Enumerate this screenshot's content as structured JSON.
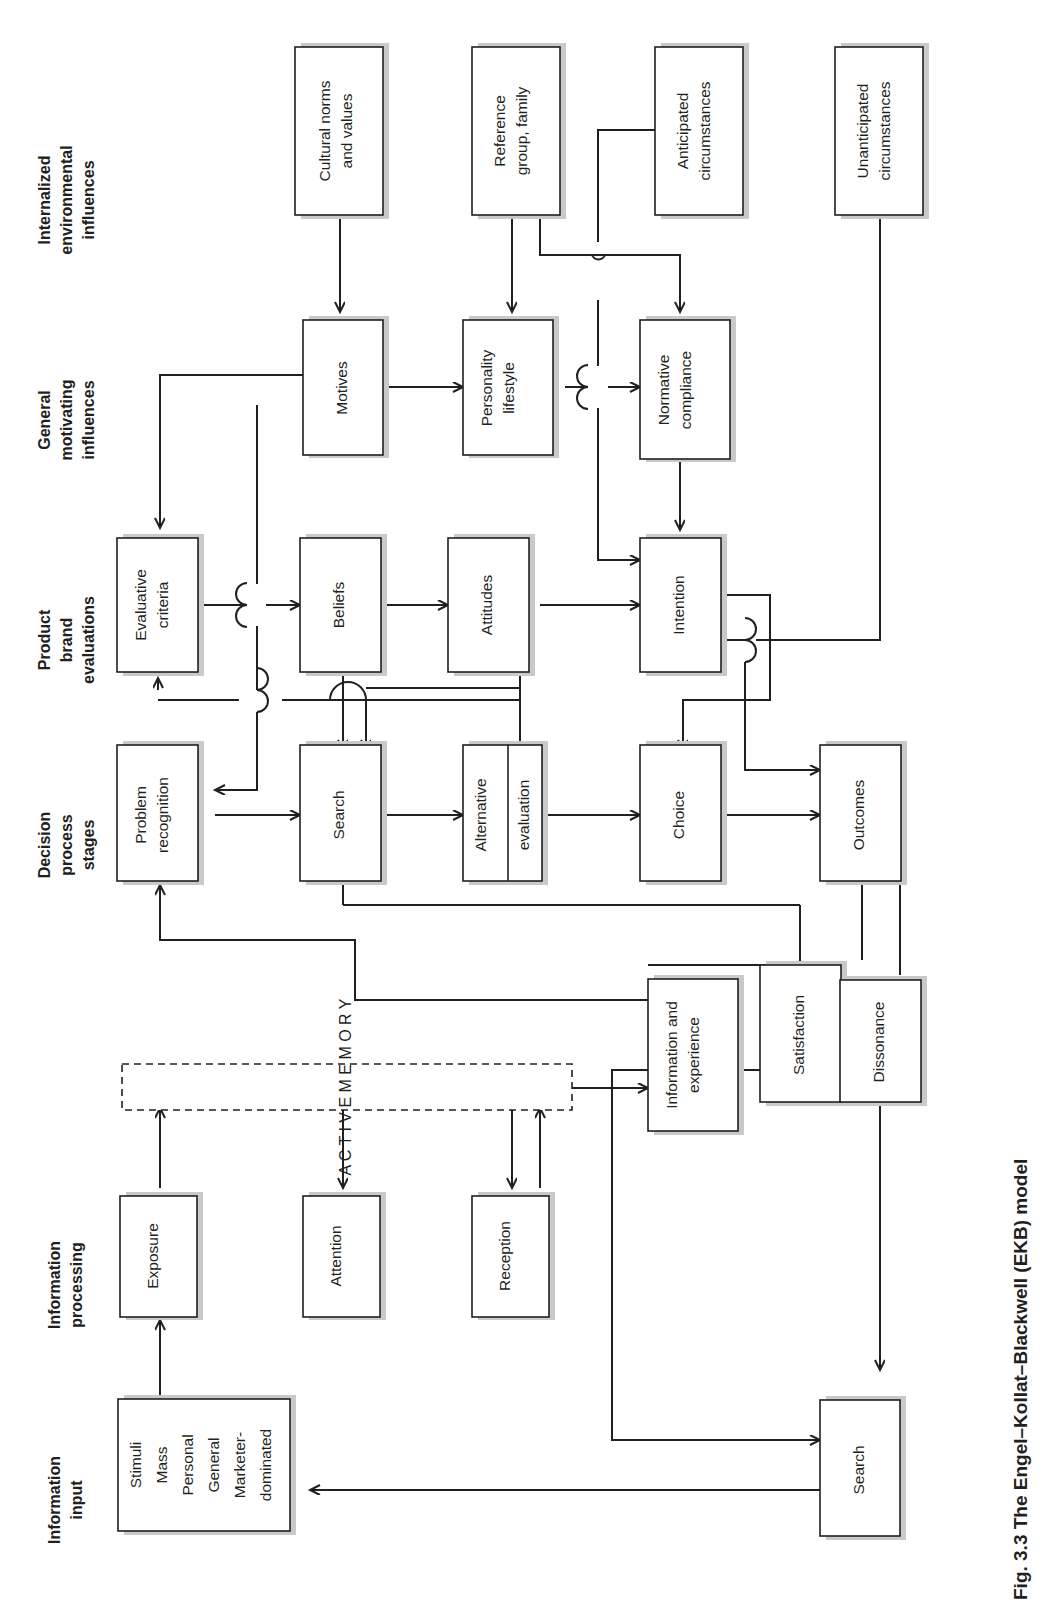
{
  "figure": {
    "caption": "Fig. 3.3  The Engel–Kollat–Blackwell (EKB) model",
    "orientation": "rotated-90-ccw",
    "colors": {
      "ink": "#231f20",
      "shadow": "#c9c9c9",
      "paper": "#ffffff"
    }
  },
  "columns": [
    {
      "id": "internalized",
      "label": "Internalized\nenvironmental\ninfluences"
    },
    {
      "id": "general",
      "label": "General\nmotivating\ninfluences"
    },
    {
      "id": "product",
      "label": "Product\nbrand\nevaluations"
    },
    {
      "id": "decision",
      "label": "Decision\nprocess\nstages"
    },
    {
      "id": "processing",
      "label": "Information\nprocessing"
    },
    {
      "id": "input",
      "label": "Information\ninput"
    }
  ],
  "column_labels": {
    "internalized": [
      "Internalized",
      "environmental",
      "influences"
    ],
    "general": [
      "General",
      "motivating",
      "influences"
    ],
    "product": [
      "Product",
      "brand",
      "evaluations"
    ],
    "decision": [
      "Decision",
      "process",
      "stages"
    ],
    "processing": [
      "Information",
      "processing"
    ],
    "input": [
      "Information",
      "input"
    ]
  },
  "boxes": [
    {
      "id": "cultural-norms",
      "lines": [
        "Cultural norms",
        "and values"
      ],
      "column": "internalized"
    },
    {
      "id": "reference-group",
      "lines": [
        "Reference",
        "group, family"
      ],
      "column": "internalized"
    },
    {
      "id": "anticipated",
      "lines": [
        "Anticipated",
        "circumstances"
      ],
      "column": "internalized"
    },
    {
      "id": "unanticipated",
      "lines": [
        "Unanticipated",
        "circumstances"
      ],
      "column": "internalized"
    },
    {
      "id": "motives",
      "lines": [
        "Motives"
      ],
      "column": "general"
    },
    {
      "id": "personality",
      "lines": [
        "Personality",
        "lifestyle"
      ],
      "column": "general"
    },
    {
      "id": "normative",
      "lines": [
        "Normative",
        "compliance"
      ],
      "column": "general"
    },
    {
      "id": "evaluative-criteria",
      "lines": [
        "Evaluative",
        "criteria"
      ],
      "column": "product"
    },
    {
      "id": "beliefs",
      "lines": [
        "Beliefs"
      ],
      "column": "product"
    },
    {
      "id": "attitudes",
      "lines": [
        "Attitudes"
      ],
      "column": "product"
    },
    {
      "id": "intention",
      "lines": [
        "Intention"
      ],
      "column": "product"
    },
    {
      "id": "problem-recognition",
      "lines": [
        "Problem",
        "recognition"
      ],
      "column": "decision"
    },
    {
      "id": "search-stage",
      "lines": [
        "Search"
      ],
      "column": "decision"
    },
    {
      "id": "alternative-evaluation",
      "lines": [
        "Alternative",
        "evaluation"
      ],
      "column": "decision",
      "split": true
    },
    {
      "id": "choice",
      "lines": [
        "Choice"
      ],
      "column": "decision"
    },
    {
      "id": "outcomes",
      "lines": [
        "Outcomes"
      ],
      "column": "decision"
    },
    {
      "id": "satisfaction",
      "lines": [
        "Satisfaction"
      ],
      "column": "decision"
    },
    {
      "id": "dissonance",
      "lines": [
        "Dissonance"
      ],
      "column": "decision"
    },
    {
      "id": "information-experience",
      "lines": [
        "Information and",
        "experience"
      ],
      "column": "processing"
    },
    {
      "id": "exposure",
      "lines": [
        "Exposure"
      ],
      "column": "processing"
    },
    {
      "id": "attention",
      "lines": [
        "Attention"
      ],
      "column": "processing"
    },
    {
      "id": "reception",
      "lines": [
        "Reception"
      ],
      "column": "processing"
    },
    {
      "id": "stimuli",
      "lines": [
        "Stimuli",
        "Mass",
        "Personal",
        "General",
        "Marketer-",
        "dominated"
      ],
      "column": "input"
    },
    {
      "id": "search-input",
      "lines": [
        "Search"
      ],
      "column": "input"
    }
  ],
  "active_memory": {
    "id": "active-memory",
    "text": "A C T I V E   M E M O R Y",
    "style": "dashed"
  }
}
